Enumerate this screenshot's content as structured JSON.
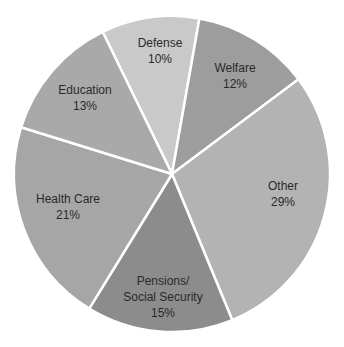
{
  "chart_data": {
    "type": "pie",
    "title": "",
    "categories": [
      "Defense",
      "Welfare",
      "Other",
      "Pensions/ Social Security",
      "Health Care",
      "Education"
    ],
    "values": [
      10,
      12,
      29,
      15,
      21,
      13
    ],
    "unit": "%",
    "labels": [
      {
        "lines": [
          "Defense",
          "10%"
        ]
      },
      {
        "lines": [
          "Welfare",
          "12%"
        ]
      },
      {
        "lines": [
          "Other",
          "29%"
        ]
      },
      {
        "lines": [
          "Pensions/",
          "Social Security",
          "15%"
        ]
      },
      {
        "lines": [
          "Health Care",
          "21%"
        ]
      },
      {
        "lines": [
          "Education",
          "13%"
        ]
      }
    ],
    "colors": [
      "#c9c9c9",
      "#9d9d9d",
      "#b3b3b3",
      "#8c8c8c",
      "#a6a6a6",
      "#a9a9a9"
    ],
    "legend": "none",
    "grid": false
  },
  "labels": {
    "defense": {
      "name": "Defense",
      "pct": "10%"
    },
    "welfare": {
      "name": "Welfare",
      "pct": "12%"
    },
    "other": {
      "name": "Other",
      "pct": "29%"
    },
    "pensions": {
      "name1": "Pensions/",
      "name2": "Social Security",
      "pct": "15%"
    },
    "health": {
      "name": "Health Care",
      "pct": "21%"
    },
    "education": {
      "name": "Education",
      "pct": "13%"
    }
  }
}
